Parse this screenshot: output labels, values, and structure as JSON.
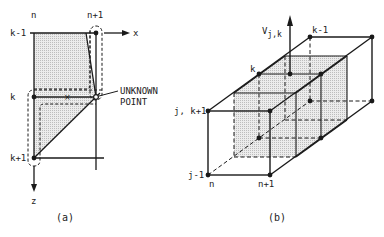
{
  "figure_a": {
    "caption": "(a)",
    "columns": [
      "n",
      "n+1"
    ],
    "rows": [
      "k-1",
      "k",
      "k+1"
    ],
    "axis_x": "x",
    "axis_z": "z",
    "annotation_line1": "UNKNOWN",
    "annotation_line2": "POINT"
  },
  "figure_b": {
    "caption": "(b)",
    "velocity_label_main": "V",
    "velocity_label_sub": "j,k",
    "labels": {
      "k_minus_1": "k-1",
      "k": "k",
      "j_k_plus_1": "j, k+1",
      "j_minus_1": "j-1",
      "n": "n",
      "n_plus_1": "n+1"
    }
  },
  "colors": {
    "line": "#1a1a1a",
    "shade": "#d9d9d9",
    "background": "#ffffff"
  }
}
